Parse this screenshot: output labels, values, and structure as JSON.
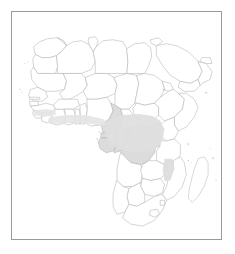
{
  "figure": {
    "type": "distribution-map",
    "region": "Africa",
    "title": "",
    "caption": "",
    "frame": {
      "border_color": "#9a9a9a",
      "background_color": "#ffffff",
      "x": 11,
      "y": 11,
      "width": 211,
      "height": 229
    },
    "projection_note": ""
  },
  "style": {
    "country_fill": "#ffffff",
    "country_outline": "#b2b2b2",
    "highlight_fill": "#dcdcdc",
    "highlight_soft_fill": "#e8e8e8",
    "range_band_fill": "#dedede",
    "coast_band_fill": "#e4e4e4",
    "page_background": "#ffffff"
  },
  "legend": {
    "present": false,
    "entries": []
  },
  "axes": {
    "present": false,
    "labels": [],
    "ticks": []
  },
  "map_content": {
    "shaded_description": "Light grey shaded band across equatorial Central Africa and a thin strip along the Gulf of Guinea coast",
    "highlighted_regions": [
      {
        "name": "Cameroon",
        "shade": "highlighted"
      },
      {
        "name": "Equatorial Guinea",
        "shade": "highlighted"
      },
      {
        "name": "Gabon",
        "shade": "highlighted"
      },
      {
        "name": "Republic of the Congo",
        "shade": "highlighted"
      },
      {
        "name": "Democratic Republic of the Congo",
        "shade": "highlighted"
      },
      {
        "name": "Uganda",
        "shade": "highlighted"
      },
      {
        "name": "Rwanda",
        "shade": "highlighted"
      },
      {
        "name": "Burundi",
        "shade": "highlighted"
      },
      {
        "name": "Malawi",
        "shade": "highlighted"
      },
      {
        "name": "Cote d'Ivoire",
        "shade": "coastal-strip"
      },
      {
        "name": "Ghana",
        "shade": "coastal-strip"
      },
      {
        "name": "Togo",
        "shade": "coastal-strip"
      },
      {
        "name": "Benin",
        "shade": "coastal-strip"
      },
      {
        "name": "Nigeria",
        "shade": "coastal-strip"
      }
    ],
    "unshaded_regions": [
      "Morocco",
      "Western Sahara",
      "Algeria",
      "Tunisia",
      "Libya",
      "Egypt",
      "Mauritania",
      "Mali",
      "Niger",
      "Chad",
      "Sudan",
      "South Sudan",
      "Eritrea",
      "Djibouti",
      "Ethiopia",
      "Somalia",
      "Senegal",
      "Gambia",
      "Guinea-Bissau",
      "Guinea",
      "Sierra Leone",
      "Liberia",
      "Burkina Faso",
      "Central African Republic",
      "Kenya",
      "Tanzania",
      "Angola",
      "Zambia",
      "Zimbabwe",
      "Mozambique",
      "Botswana",
      "Namibia",
      "South Africa",
      "Lesotho",
      "Eswatini",
      "Madagascar",
      "Saudi Arabia",
      "Yemen",
      "Oman"
    ]
  },
  "annotations": []
}
